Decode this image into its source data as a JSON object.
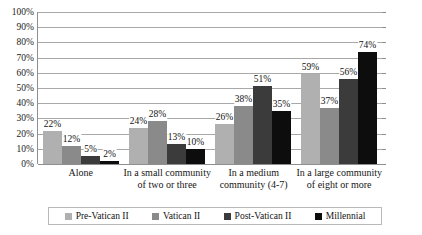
{
  "chart_data": {
    "type": "bar",
    "title": "",
    "subtitle": "",
    "xlabel": "",
    "ylabel": "",
    "ylim": [
      0,
      100
    ],
    "yticks": [
      "0%",
      "10%",
      "20%",
      "30%",
      "40%",
      "50%",
      "60%",
      "70%",
      "80%",
      "90%",
      "100%"
    ],
    "ytick_values": [
      0,
      10,
      20,
      30,
      40,
      50,
      60,
      70,
      80,
      90,
      100
    ],
    "grid": true,
    "legend_position": "bottom",
    "value_suffix": "%",
    "categories": [
      "Alone",
      "In a small community of two or three",
      "In a medium community (4-7)",
      "In a large community of eight or more"
    ],
    "category_lines": [
      [
        "Alone"
      ],
      [
        "In a small community",
        "of two or three"
      ],
      [
        "In a medium",
        "community (4-7)"
      ],
      [
        "In a large community",
        "of eight or more"
      ]
    ],
    "series": [
      {
        "name": "Pre-Vatican II",
        "color": "#b0b0b0",
        "values": [
          22,
          24,
          26,
          59
        ],
        "labels": [
          "22%",
          "24%",
          "26%",
          "59%"
        ]
      },
      {
        "name": "Vatican II",
        "color": "#8a8a8a",
        "values": [
          12,
          28,
          38,
          37
        ],
        "labels": [
          "12%",
          "28%",
          "38%",
          "37%"
        ]
      },
      {
        "name": "Post-Vatican II",
        "color": "#3b3b3b",
        "values": [
          5,
          13,
          51,
          56
        ],
        "labels": [
          "5%",
          "13%",
          "51%",
          "56%"
        ]
      },
      {
        "name": "Millennial",
        "color": "#0d0d0d",
        "values": [
          2,
          10,
          35,
          74
        ],
        "labels": [
          "2%",
          "10%",
          "35%",
          "74%"
        ]
      }
    ]
  },
  "colors": {
    "background": "#ffffff",
    "gridline": "#a8a8a8",
    "axis": "#8f8f8f",
    "legend_border": "#b9b9b9",
    "text": "#1a1a1a"
  }
}
